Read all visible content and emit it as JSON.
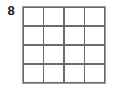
{
  "figure": {
    "row_label": "8",
    "grid": {
      "columns": 4,
      "rows": 4,
      "cells": [
        {
          "row": 1,
          "col": 1,
          "value": ""
        },
        {
          "row": 1,
          "col": 2,
          "value": ""
        },
        {
          "row": 1,
          "col": 3,
          "value": ""
        },
        {
          "row": 1,
          "col": 4,
          "value": ""
        },
        {
          "row": 2,
          "col": 1,
          "value": ""
        },
        {
          "row": 2,
          "col": 2,
          "value": ""
        },
        {
          "row": 2,
          "col": 3,
          "value": ""
        },
        {
          "row": 2,
          "col": 4,
          "value": ""
        },
        {
          "row": 3,
          "col": 1,
          "value": ""
        },
        {
          "row": 3,
          "col": 2,
          "value": ""
        },
        {
          "row": 3,
          "col": 3,
          "value": ""
        },
        {
          "row": 3,
          "col": 4,
          "value": ""
        },
        {
          "row": 4,
          "col": 1,
          "value": ""
        },
        {
          "row": 4,
          "col": 2,
          "value": ""
        },
        {
          "row": 4,
          "col": 3,
          "value": ""
        },
        {
          "row": 4,
          "col": 4,
          "value": ""
        }
      ]
    },
    "colors": {
      "background": "#ffffff",
      "cell_fill": "#ffffff",
      "grid_line": "#6b6b6b",
      "outer_border": "#9a9a9a",
      "label_text": "#1a1a1a"
    }
  }
}
